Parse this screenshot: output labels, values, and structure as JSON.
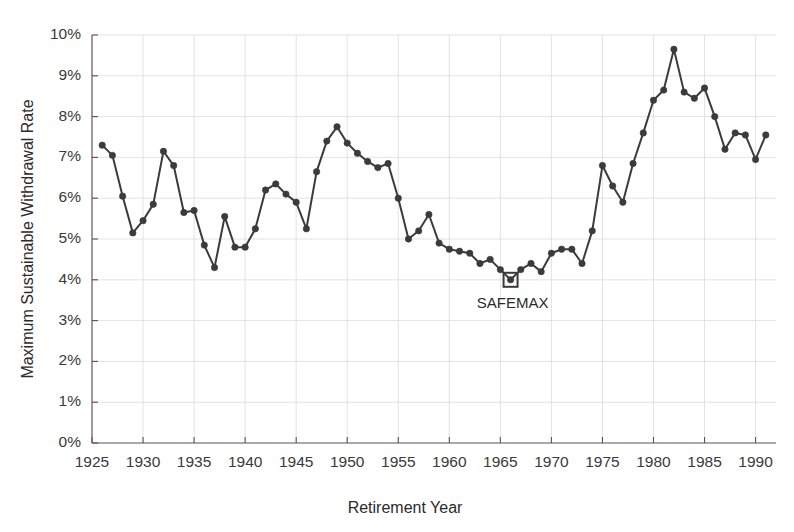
{
  "chart_data": {
    "type": "line",
    "title": "",
    "xlabel": "Retirement Year",
    "ylabel": "Maximum Sustainable Withdrawal Rate",
    "xlim": [
      1925,
      1992
    ],
    "ylim": [
      0,
      10
    ],
    "xticks": [
      1925,
      1930,
      1935,
      1940,
      1945,
      1950,
      1955,
      1960,
      1965,
      1970,
      1975,
      1980,
      1985,
      1990
    ],
    "xtick_labels": [
      "1925",
      "1930",
      "1935",
      "1940",
      "1945",
      "1950",
      "1955",
      "1960",
      "1965",
      "1970",
      "1975",
      "1980",
      "1985",
      "1990"
    ],
    "yticks": [
      0,
      1,
      2,
      3,
      4,
      5,
      6,
      7,
      8,
      9,
      10
    ],
    "ytick_labels": [
      "0%",
      "1%",
      "2%",
      "3%",
      "4%",
      "5%",
      "6%",
      "7%",
      "8%",
      "9%",
      "10%"
    ],
    "grid": true,
    "legend": "none",
    "marker": "circle",
    "line_color": "#3b3b3b",
    "grid_color": "#dcdcdc",
    "series": [
      {
        "name": "Maximum Sustainable Withdrawal Rate",
        "x": [
          1926,
          1927,
          1928,
          1929,
          1930,
          1931,
          1932,
          1933,
          1934,
          1935,
          1936,
          1937,
          1938,
          1939,
          1940,
          1941,
          1942,
          1943,
          1944,
          1945,
          1946,
          1947,
          1948,
          1949,
          1950,
          1951,
          1952,
          1953,
          1954,
          1955,
          1956,
          1957,
          1958,
          1959,
          1960,
          1961,
          1962,
          1963,
          1964,
          1965,
          1966,
          1967,
          1968,
          1969,
          1970,
          1971,
          1972,
          1973,
          1974,
          1975,
          1976,
          1977,
          1978,
          1979,
          1980,
          1981,
          1982,
          1983,
          1984,
          1985,
          1986,
          1987,
          1988,
          1989,
          1990,
          1991
        ],
        "values": [
          7.3,
          7.05,
          6.05,
          5.15,
          5.45,
          5.85,
          7.15,
          6.8,
          5.65,
          5.7,
          4.85,
          4.3,
          5.55,
          4.8,
          4.8,
          5.25,
          6.2,
          6.35,
          6.1,
          5.9,
          5.25,
          6.65,
          7.4,
          7.75,
          7.35,
          7.1,
          6.9,
          6.75,
          6.85,
          6.0,
          5.0,
          5.2,
          5.6,
          4.9,
          4.75,
          4.7,
          4.65,
          4.4,
          4.5,
          4.25,
          4.0,
          4.25,
          4.4,
          4.2,
          4.65,
          4.75,
          4.75,
          4.4,
          5.2,
          6.8,
          6.3,
          5.9,
          6.85,
          7.6,
          8.4,
          8.65,
          9.65,
          8.6,
          8.45,
          8.7,
          8.0,
          7.2,
          7.6,
          7.55,
          6.95,
          7.55
        ]
      }
    ],
    "annotations": [
      {
        "text": "SAFEMAX",
        "x": 1966,
        "y": 4.0,
        "marker": "square-outline"
      }
    ]
  }
}
